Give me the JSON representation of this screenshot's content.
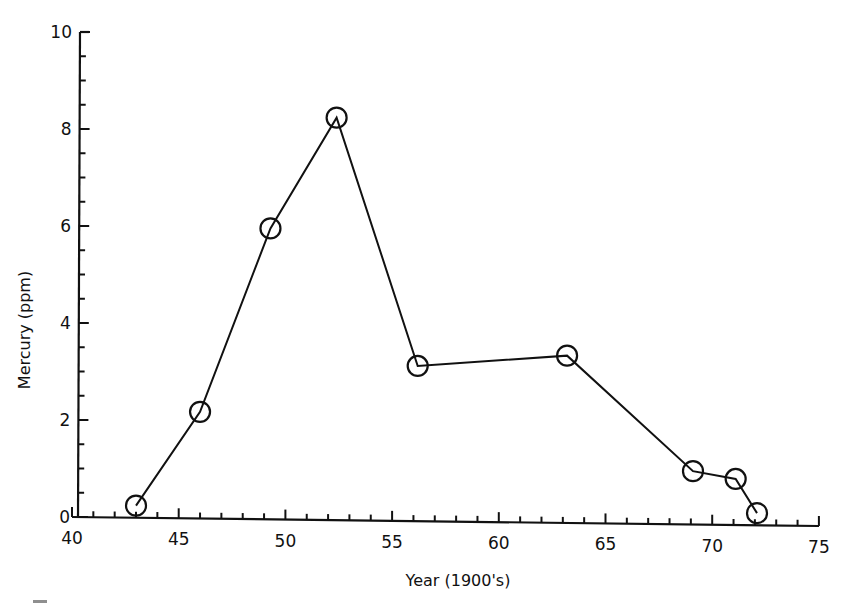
{
  "chart_data": {
    "type": "line",
    "title": "",
    "xlabel": "Year (1900's)",
    "ylabel": "Mercury (ppm)",
    "xlim": [
      40,
      75
    ],
    "ylim": [
      0,
      10
    ],
    "x_ticks": [
      40,
      45,
      50,
      55,
      60,
      65,
      70,
      75
    ],
    "y_ticks": [
      0,
      2,
      4,
      6,
      8,
      10
    ],
    "x_minor_step": 1,
    "y_minor_step": 0.5,
    "grid": false,
    "legend": null,
    "marker": "open-circle",
    "series": [
      {
        "name": "Mercury",
        "x": [
          43,
          46,
          49.3,
          52.4,
          56.2,
          63.2,
          69.1,
          71.1,
          72.1
        ],
        "y": [
          0.25,
          2.2,
          6.0,
          8.3,
          3.2,
          3.45,
          1.1,
          0.95,
          0.25
        ]
      }
    ]
  },
  "colors": {
    "ink": "#111111",
    "background": "#ffffff"
  }
}
